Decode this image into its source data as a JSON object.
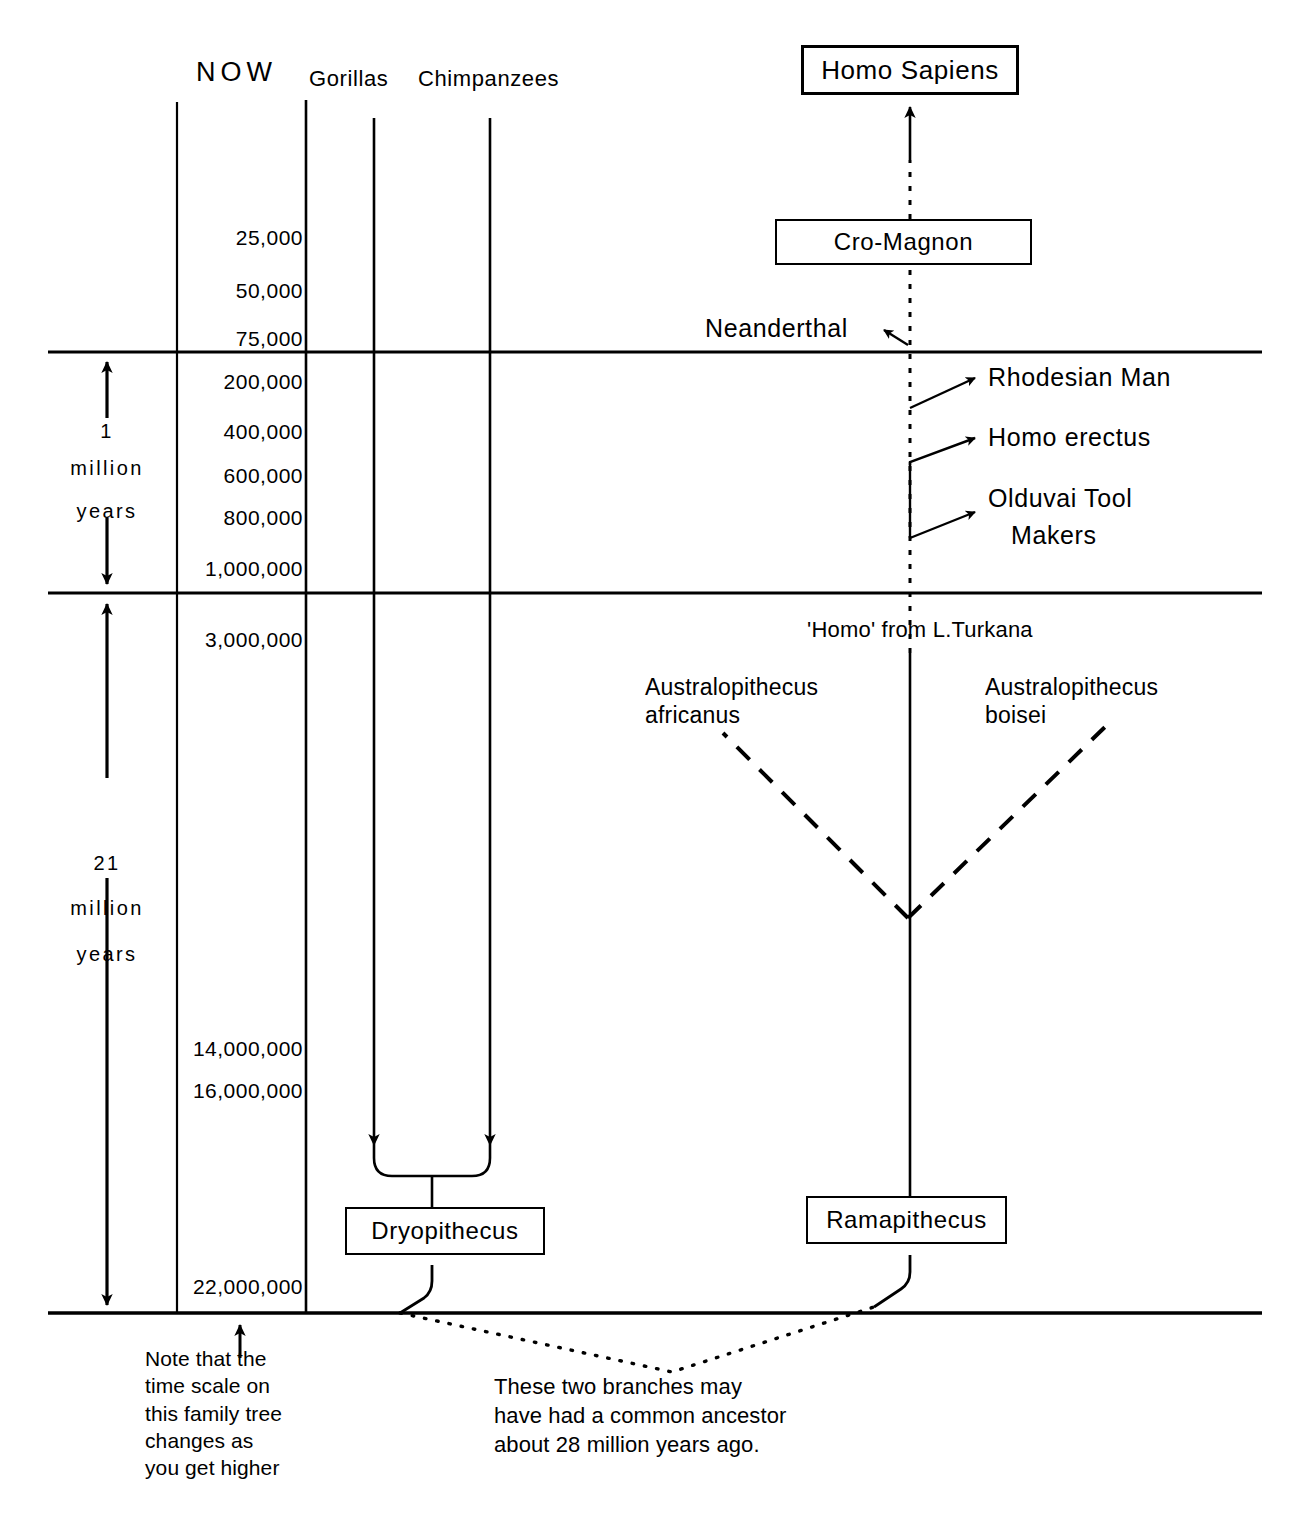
{
  "diagram": {
    "title_absent": true,
    "axis": {
      "now_label": "NOW",
      "scale_values": [
        "25,000",
        "50,000",
        "75,000",
        "200,000",
        "400,000",
        "600,000",
        "800,000",
        "1,000,000",
        "3,000,000",
        "14,000,000",
        "16,000,000",
        "22,000,000"
      ],
      "eras": [
        {
          "amount": "1",
          "unit_line1": "million",
          "unit_line2": "years"
        },
        {
          "amount": "21",
          "unit_line1": "million",
          "unit_line2": "years"
        }
      ]
    },
    "column_headers": [
      {
        "label": "Gorillas"
      },
      {
        "label": "Chimpanzees"
      }
    ],
    "boxes": [
      {
        "label": "Homo Sapiens"
      },
      {
        "label": "Cro-Magnon"
      },
      {
        "label": "Dryopithecus"
      },
      {
        "label": "Ramapithecus"
      }
    ],
    "branch_labels": [
      {
        "label": "Neanderthal"
      },
      {
        "label": "Rhodesian Man"
      },
      {
        "label": "Homo erectus"
      },
      {
        "label": "Olduvai Tool"
      },
      {
        "label": "Makers"
      }
    ],
    "turkana_label": "'Homo' from L.Turkana",
    "australopithecus": [
      {
        "line1": "Australopithecus",
        "line2": "africanus"
      },
      {
        "line1": "Australopithecus",
        "line2": "boisei"
      }
    ],
    "notes": {
      "scale_note": "Note that the\ntime scale on\nthis family tree\nchanges as\nyou get higher",
      "ancestor_note": "These two branches may\nhave had a common ancestor\nabout 28 million years ago."
    },
    "colors": {
      "ink": "#000000",
      "paper": "#ffffff"
    }
  }
}
